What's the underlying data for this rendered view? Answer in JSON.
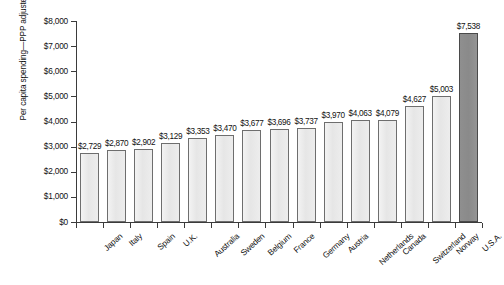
{
  "chart_data": {
    "type": "bar",
    "title": "",
    "xlabel": "",
    "ylabel": "Per capita spending—PPP adjusted",
    "ylim": [
      0,
      8000
    ],
    "ytick_labels": [
      "$0",
      "$1,000",
      "$2,000",
      "$3,000",
      "$4,000",
      "$5,000",
      "$6,000",
      "$7,000",
      "$8,000"
    ],
    "ytick_values": [
      0,
      1000,
      2000,
      3000,
      4000,
      5000,
      6000,
      7000,
      8000
    ],
    "grid": false,
    "legend": "none",
    "categories": [
      "Japan",
      "Italy",
      "Spain",
      "U.K.",
      "Australia",
      "Sweden",
      "Belgium",
      "France",
      "Germany",
      "Austria",
      "Netherlands",
      "Canada",
      "Switzerland",
      "Norway",
      "U.S.A."
    ],
    "values": [
      2729,
      2870,
      2902,
      3129,
      3353,
      3470,
      3677,
      3696,
      3737,
      3970,
      4063,
      4079,
      4627,
      5003,
      7538
    ],
    "data_labels": [
      "$2,729",
      "$2,870",
      "$2,902",
      "$3,129",
      "$3,353",
      "$3,470",
      "$3,677",
      "$3,696",
      "$3,737",
      "$3,970",
      "$4,063",
      "$4,079",
      "$4,627",
      "$5,003",
      "$7,538"
    ],
    "highlight_index": 14,
    "colors": {
      "bar_fill": "#e9e9e9",
      "bar_border": "#6e6e6e",
      "highlight_fill": "#8a8a8a",
      "highlight_border": "#4a4a4a",
      "axis": "#3b3b3b",
      "text": "#111111",
      "background": "#ffffff"
    }
  }
}
